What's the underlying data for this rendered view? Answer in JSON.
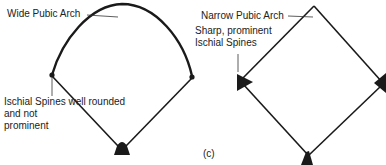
{
  "figure": {
    "panel_label": "(c)",
    "left_pelvis": {
      "arch_label": "Wide Pubic Arch",
      "spines_label_line1": "Ischial Spines well rounded",
      "spines_label_line2": "and not",
      "spines_label_line3": "prominent"
    },
    "right_pelvis": {
      "arch_label": "Narrow Pubic Arch",
      "spines_label_line1": "Sharp, prominent",
      "spines_label_line2": "Ischial Spines"
    }
  }
}
